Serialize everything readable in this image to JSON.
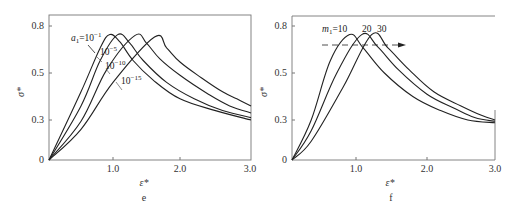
{
  "chart_data": [
    {
      "panel": "e",
      "type": "line",
      "caption": "e",
      "xlabel": "ε*",
      "ylabel": "σ*",
      "xlim": [
        0,
        3.0
      ],
      "ylim": [
        0,
        0.85
      ],
      "xticks": [
        "1.0",
        "2.0",
        "3.0"
      ],
      "xtick_values": [
        1.0,
        2.0,
        3.0
      ],
      "yticks": [
        "0",
        "0.3",
        "0.5",
        "0.8"
      ],
      "ytick_values": [
        0,
        0.3,
        0.5,
        0.8
      ],
      "grid": false,
      "annotation": "a₁=10⁻¹",
      "series": [
        {
          "name": "a1=10^-1",
          "label": "a₁=10⁻¹",
          "x": [
            0,
            0.5,
            0.8,
            0.95,
            1.1,
            1.3,
            1.6,
            2.0,
            2.5,
            3.0
          ],
          "y": [
            0,
            0.42,
            0.66,
            0.745,
            0.7,
            0.58,
            0.47,
            0.39,
            0.34,
            0.3
          ]
        },
        {
          "name": "a1=10^-5",
          "label": "10⁻⁵",
          "x": [
            0,
            0.5,
            0.8,
            1.07,
            1.25,
            1.45,
            1.8,
            2.2,
            2.6,
            3.0
          ],
          "y": [
            0,
            0.36,
            0.58,
            0.745,
            0.69,
            0.58,
            0.46,
            0.39,
            0.34,
            0.31
          ]
        },
        {
          "name": "a1=10^-10",
          "label": "10⁻¹⁰",
          "x": [
            0,
            0.5,
            0.9,
            1.33,
            1.5,
            1.7,
            2.0,
            2.4,
            2.7,
            3.0
          ],
          "y": [
            0,
            0.29,
            0.52,
            0.74,
            0.69,
            0.59,
            0.49,
            0.41,
            0.36,
            0.33
          ]
        },
        {
          "name": "a1=10^-15",
          "label": "10⁻¹⁵",
          "x": [
            0,
            0.5,
            1.0,
            1.62,
            1.8,
            2.0,
            2.3,
            2.6,
            2.8,
            3.0
          ],
          "y": [
            0,
            0.23,
            0.46,
            0.73,
            0.66,
            0.57,
            0.48,
            0.42,
            0.39,
            0.36
          ]
        }
      ]
    },
    {
      "panel": "f",
      "type": "line",
      "caption": "f",
      "xlabel": "ε*",
      "ylabel": "σ*",
      "xlim": [
        0,
        3.0
      ],
      "ylim": [
        0,
        0.85
      ],
      "xticks": [
        "1.0",
        "2.0",
        "3.0"
      ],
      "xtick_values": [
        1.0,
        2.0,
        3.0
      ],
      "yticks": [
        "0",
        "0.3",
        "0.5",
        "0.8"
      ],
      "ytick_values": [
        0,
        0.3,
        0.5,
        0.8
      ],
      "grid": false,
      "annotation": "m₁=10  20  30",
      "arrow": {
        "from": [
          0.4,
          0.7
        ],
        "to": [
          1.6,
          0.7
        ],
        "style": "dashed"
      },
      "series": [
        {
          "name": "m1=10",
          "label": "m₁=10",
          "x": [
            0,
            0.3,
            0.6,
            0.9,
            1.1,
            1.4,
            1.8,
            2.2,
            2.6,
            3.0
          ],
          "y": [
            0,
            0.3,
            0.58,
            0.745,
            0.66,
            0.5,
            0.4,
            0.34,
            0.3,
            0.28
          ]
        },
        {
          "name": "m1=20",
          "label": "20",
          "x": [
            0,
            0.3,
            0.7,
            1.08,
            1.3,
            1.6,
            2.0,
            2.4,
            2.7,
            3.0
          ],
          "y": [
            0,
            0.22,
            0.5,
            0.745,
            0.67,
            0.52,
            0.41,
            0.35,
            0.31,
            0.29
          ]
        },
        {
          "name": "m1=30",
          "label": "30",
          "x": [
            0,
            0.3,
            0.8,
            1.22,
            1.45,
            1.75,
            2.1,
            2.5,
            2.8,
            3.0
          ],
          "y": [
            0,
            0.14,
            0.44,
            0.745,
            0.66,
            0.52,
            0.42,
            0.36,
            0.32,
            0.3
          ]
        }
      ]
    }
  ]
}
